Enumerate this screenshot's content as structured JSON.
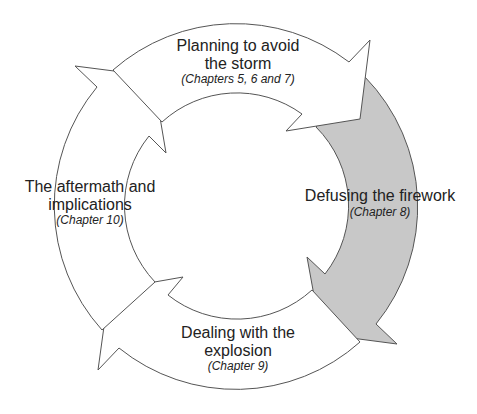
{
  "diagram": {
    "type": "cycle",
    "stages": [
      {
        "title_lines": [
          "Planning to avoid",
          "the storm"
        ],
        "chapters": "(Chapters 5, 6 and 7)",
        "highlighted": false
      },
      {
        "title_lines": [
          "Defusing the firework"
        ],
        "chapters": "(Chapter 8)",
        "highlighted": true
      },
      {
        "title_lines": [
          "Dealing with the",
          "explosion"
        ],
        "chapters": "(Chapter 9)",
        "highlighted": false
      },
      {
        "title_lines": [
          "The aftermath and",
          "implications"
        ],
        "chapters": "(Chapter 10)",
        "highlighted": false
      }
    ],
    "colors": {
      "arrow_fill": "#ffffff",
      "highlight_fill": "#c8c8c8",
      "stroke": "#555555",
      "text": "#222222"
    }
  }
}
